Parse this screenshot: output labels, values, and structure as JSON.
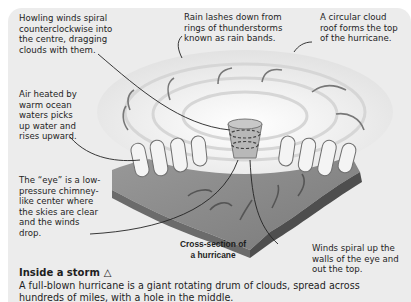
{
  "diagram": {
    "caption": "Cross-section of a hurricane",
    "labels": {
      "howling_winds": "Howling winds spiral counterclockwise into the centre, dragging clouds with them.",
      "rain_lashes": "Rain lashes down from rings of thunderstorms known as rain bands.",
      "cloud_roof": "A circular cloud roof forms the top of the hurricane.",
      "air_heated": "Air heated by warm ocean waters picks up water and rises upward.",
      "eye": "The “eye” is a low-pressure chimney-like center where the skies are clear and the winds drop.",
      "winds_spiral_up": "Winds spiral up the walls of the eye and out the top."
    }
  },
  "section": {
    "title": "Inside a storm",
    "title_icon": "△",
    "body": "A full-blown hurricane is a giant rotating drum of clouds, spread across hundreds of miles, with a hole in the middle."
  },
  "colors": {
    "panel": "#ececec",
    "cloud": "#f7f7f7",
    "slab_top": "#8a8a8a",
    "slab_side": "#505050"
  }
}
